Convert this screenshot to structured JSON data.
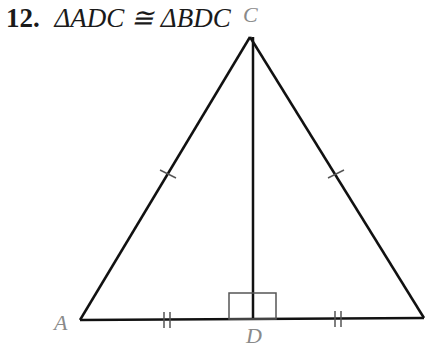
{
  "problem": {
    "number": "12.",
    "statement": "ΔADC ≅ ΔBDC"
  },
  "diagram": {
    "labels": {
      "A": "A",
      "B": "B",
      "C": "C",
      "D": "D"
    },
    "marks": [
      "AC ≅ BC (single tick)",
      "AD ≅ DB (double tick)",
      "CD ⊥ AB (right angle at D)"
    ],
    "colors": {
      "line": "#111111",
      "label": "#8a8a8a",
      "mark": "#555555"
    }
  }
}
